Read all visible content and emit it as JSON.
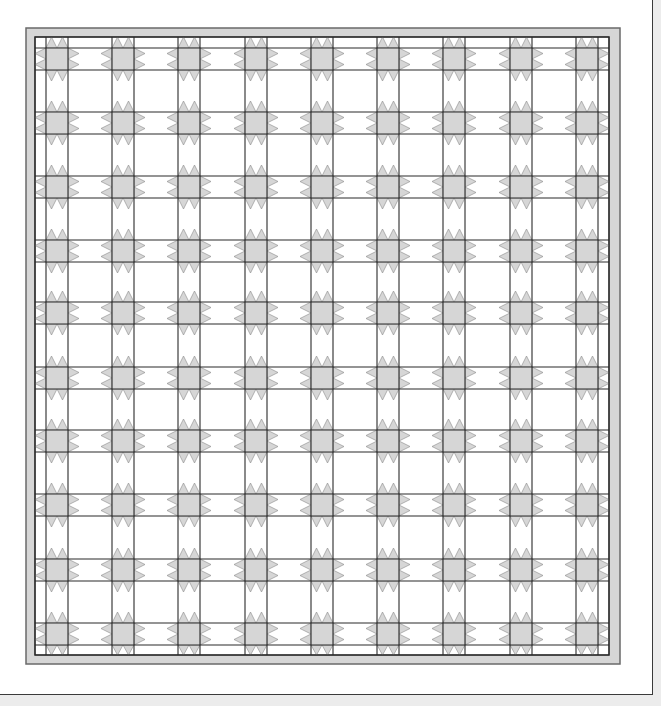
{
  "diagram": {
    "type": "quilt-layout",
    "colors": {
      "background": "#ececec",
      "panel": "#ffffff",
      "border_fill": "#d6d6d6",
      "star_fill": "#d6d6d6",
      "line": "#2a2a2a",
      "border_line": "#6a6a6a"
    },
    "outer_border": {
      "x": 26,
      "y": 28,
      "width": 594,
      "height": 636
    },
    "inner_field": {
      "x": 35,
      "y": 37,
      "width": 574,
      "height": 618
    },
    "star_size": 22,
    "point_length": 11,
    "columns_x": [
      46,
      112,
      178,
      245,
      311,
      377,
      443,
      510,
      576
    ],
    "rows_y": [
      48,
      112,
      176,
      240,
      302,
      367,
      430,
      494,
      559,
      623
    ],
    "grid": {
      "columns": 9,
      "rows": 10,
      "star_count": 90
    }
  }
}
